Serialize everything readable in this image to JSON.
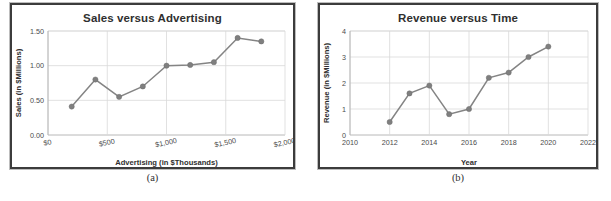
{
  "figure": {
    "panels": [
      {
        "caption": "(a)"
      },
      {
        "caption": "(b)"
      }
    ]
  },
  "chart_data": [
    {
      "type": "line",
      "title": "Sales versus Advertising",
      "xlabel": "Advertising (in $Thousands)",
      "ylabel": "Sales (in $Millions)",
      "x": [
        200,
        400,
        600,
        800,
        1000,
        1200,
        1400,
        1600,
        1800
      ],
      "values": [
        0.41,
        0.8,
        0.55,
        0.7,
        1.0,
        1.01,
        1.05,
        1.4,
        1.35
      ],
      "xlim": [
        0,
        2000
      ],
      "ylim": [
        0.0,
        1.5
      ],
      "xticks": [
        0,
        500,
        1000,
        1500,
        2000
      ],
      "xticklabels": [
        "$0",
        "$500",
        "$1,000",
        "$1,500",
        "$2,000"
      ],
      "yticks": [
        0.0,
        0.5,
        1.0,
        1.5
      ],
      "yticklabels": [
        "0.00",
        "0.50",
        "1.00",
        "1.50"
      ],
      "grid": true,
      "legend": "none",
      "marker_color": "#7f7f7f",
      "line_color": "#848484"
    },
    {
      "type": "line",
      "title": "Revenue versus Time",
      "xlabel": "Year",
      "ylabel": "Revenue (in $Millions)",
      "x": [
        2012,
        2013,
        2014,
        2015,
        2016,
        2017,
        2018,
        2019,
        2020
      ],
      "values": [
        0.5,
        1.6,
        1.9,
        0.8,
        1.0,
        2.2,
        2.4,
        3.0,
        3.4
      ],
      "xlim": [
        2010,
        2022
      ],
      "ylim": [
        0,
        4
      ],
      "xticks": [
        2010,
        2012,
        2014,
        2016,
        2018,
        2020,
        2022
      ],
      "xticklabels": [
        "2010",
        "2012",
        "2014",
        "2016",
        "2018",
        "2020",
        "2022"
      ],
      "yticks": [
        0,
        1,
        2,
        3,
        4
      ],
      "yticklabels": [
        "0",
        "1",
        "2",
        "3",
        "4"
      ],
      "grid": true,
      "legend": "none",
      "marker_color": "#7f7f7f",
      "line_color": "#848484"
    }
  ]
}
